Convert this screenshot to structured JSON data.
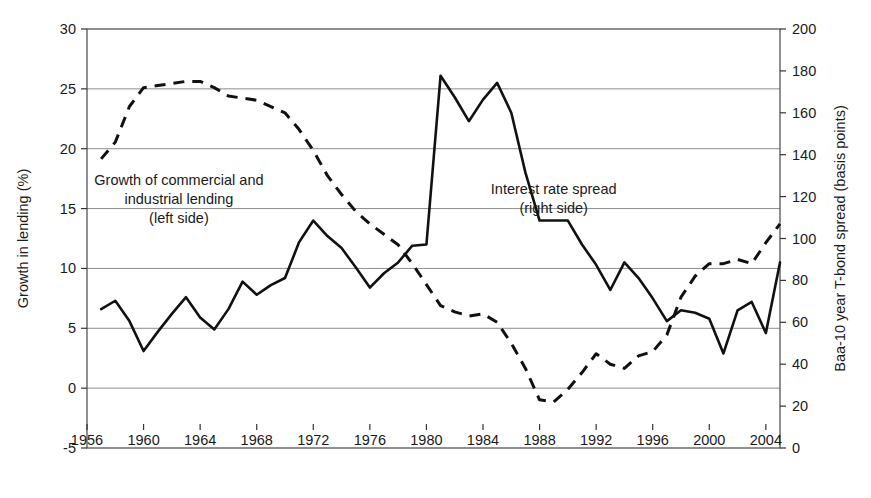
{
  "chart_data": {
    "type": "line",
    "title": "",
    "xlabel": "",
    "ylabel": "Growth in lending (%)",
    "y2label": "Baa-10 year T-bond spread (basis points)",
    "xlim": [
      1956,
      2005
    ],
    "ylim": [
      -5,
      30
    ],
    "y2lim": [
      0,
      200
    ],
    "grid": true,
    "legend_position": "inline-annotations",
    "x_ticks": [
      1956,
      1960,
      1964,
      1968,
      1972,
      1976,
      1980,
      1984,
      1988,
      1992,
      1996,
      2000,
      2004
    ],
    "x_tick_labels": [
      "1956",
      "1960",
      "1964",
      "1968",
      "1972",
      "1976",
      "1980",
      "1984",
      "1988",
      "1992",
      "1996",
      "2000",
      "2004"
    ],
    "y_ticks": [
      -5,
      0,
      5,
      10,
      15,
      20,
      25,
      30
    ],
    "y_tick_labels": [
      "-5",
      "0",
      "5",
      "10",
      "15",
      "20",
      "25",
      "30"
    ],
    "y2_ticks": [
      0,
      20,
      40,
      60,
      80,
      100,
      120,
      140,
      160,
      180,
      200
    ],
    "y2_tick_labels": [
      "0",
      "20",
      "40",
      "60",
      "80",
      "100",
      "120",
      "140",
      "160",
      "180",
      "200"
    ],
    "annotations": [
      {
        "name": "lending-annotation",
        "lines": [
          "Growth of commercial and",
          "industrial lending",
          "(left side)"
        ],
        "x": 1962.5,
        "y": 17.0
      },
      {
        "name": "spread-annotation",
        "lines": [
          "Interest rate spread",
          "(right side)"
        ],
        "x": 1989.0,
        "y": 16.2
      }
    ],
    "series": [
      {
        "name": "Growth of commercial and industrial lending",
        "axis": "left",
        "style": "solid",
        "unit": "%",
        "x": [
          1957,
          1958,
          1959,
          1960,
          1961,
          1962,
          1963,
          1964,
          1965,
          1966,
          1967,
          1968,
          1969,
          1970,
          1971,
          1972,
          1973,
          1974,
          1975,
          1976,
          1977,
          1978,
          1979,
          1980,
          1981,
          1982,
          1983,
          1984,
          1985,
          1986,
          1987,
          1988,
          1989,
          1990,
          1991,
          1992,
          1993,
          1994,
          1995,
          1996,
          1997,
          1998,
          1999,
          2000,
          2001,
          2002,
          2003,
          2004,
          2005
        ],
        "values": [
          6.6,
          7.3,
          5.6,
          3.1,
          4.7,
          6.2,
          7.6,
          5.9,
          4.9,
          6.6,
          8.9,
          7.8,
          8.6,
          9.2,
          12.2,
          14.0,
          12.7,
          11.7,
          10.1,
          8.4,
          9.6,
          10.5,
          11.9,
          12.0,
          26.1,
          24.3,
          22.3,
          24.1,
          25.5,
          23.0,
          18.0,
          14.0,
          14.0,
          14.0,
          12.0,
          10.3,
          8.2,
          10.5,
          9.2,
          7.5,
          5.6,
          6.5,
          6.3,
          5.8,
          2.9,
          6.5,
          7.2,
          4.6,
          10.5
        ]
      },
      {
        "name": "Interest rate spread",
        "axis": "right",
        "style": "dashed",
        "unit": "basis points",
        "x": [
          1957,
          1958,
          1959,
          1960,
          1961,
          1962,
          1963,
          1964,
          1965,
          1966,
          1967,
          1968,
          1969,
          1970,
          1971,
          1972,
          1973,
          1974,
          1975,
          1976,
          1977,
          1978,
          1979,
          1980,
          1981,
          1982,
          1983,
          1984,
          1985,
          1986,
          1987,
          1988,
          1989,
          1990,
          1991,
          1992,
          1993,
          1994,
          1995,
          1996,
          1997,
          1998,
          1999,
          2000,
          2001,
          2002,
          2003,
          2004,
          2005
        ],
        "values": [
          138,
          146,
          163,
          172,
          173,
          174,
          175,
          175,
          172,
          168,
          167,
          166,
          163,
          160,
          152,
          142,
          130,
          121,
          113,
          107,
          102,
          97,
          88,
          78,
          68,
          65,
          63,
          64,
          60,
          50,
          38,
          23,
          22,
          28,
          36,
          45,
          40,
          38,
          44,
          46,
          54,
          72,
          82,
          88,
          88,
          90,
          88,
          98,
          107
        ]
      }
    ]
  }
}
